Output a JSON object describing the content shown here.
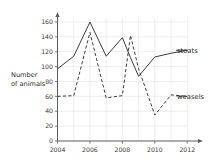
{
  "chart_data": {
    "type": "line",
    "title": "",
    "xlabel": "",
    "ylabel": "Number of animals",
    "xlim": [
      2004,
      2012
    ],
    "ylim": [
      0,
      160
    ],
    "grid": true,
    "legend_position": "right-inline-labels",
    "x_ticks": [
      "2004",
      "2006",
      "2008",
      "2010",
      "2012"
    ],
    "x_tick_values": [
      2004,
      2006,
      2008,
      2010,
      2012
    ],
    "y_ticks": [
      "0",
      "20",
      "40",
      "60",
      "80",
      "100",
      "120",
      "140",
      "160"
    ],
    "y_tick_values": [
      0,
      20,
      40,
      60,
      80,
      100,
      120,
      140,
      160
    ],
    "series": [
      {
        "name": "stoats",
        "style": "solid",
        "label": "stoats",
        "x": [
          2004,
          2005,
          2006,
          2007,
          2008,
          2008.5,
          2009,
          2010,
          2011,
          2012
        ],
        "values": [
          97,
          114,
          160,
          114,
          139,
          112,
          87,
          113,
          118,
          122
        ]
      },
      {
        "name": "weasels",
        "style": "dashed",
        "label": "weasels",
        "x": [
          2004,
          2005,
          2006,
          2007,
          2008,
          2008.5,
          2009,
          2010,
          2011,
          2012
        ],
        "values": [
          60,
          61,
          146,
          58,
          61,
          142,
          97,
          35,
          62,
          60
        ]
      }
    ]
  },
  "axis": {
    "y_title_line1": "Number",
    "y_title_line2": "of animals"
  },
  "labels": {
    "stoats": "stoats",
    "weasels": "weasels"
  },
  "colors": {
    "line": "#3c3c3c",
    "grid": "#e2e2e6",
    "axis": "#5b5b5b",
    "text": "#2b2b2b",
    "background": "#ffffff"
  }
}
